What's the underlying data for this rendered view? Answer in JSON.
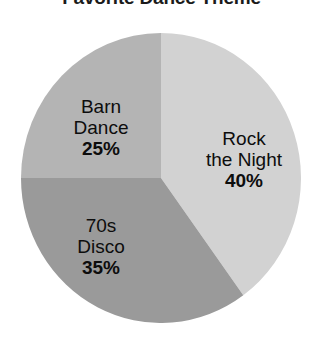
{
  "chart_data": {
    "type": "pie",
    "title": "Favorite Dance Theme",
    "categories": [
      "Rock the Night",
      "70s Disco",
      "Barn Dance"
    ],
    "values": [
      40,
      35,
      25
    ],
    "value_labels": [
      "40%",
      "35%",
      "25%"
    ],
    "units": "percent",
    "total": 100,
    "legend": "none",
    "grid": false,
    "start_angle_deg": 0,
    "direction": "clockwise",
    "slices": [
      {
        "label": "Rock the Night",
        "label_line1": "Rock",
        "label_line2": "the Night",
        "value": 40,
        "value_label": "40%",
        "color": "#d2d2d2",
        "start_deg": 0,
        "end_deg": 144
      },
      {
        "label": "70s Disco",
        "label_line1": "70s",
        "label_line2": "Disco",
        "value": 35,
        "value_label": "35%",
        "color": "#9a9a9a",
        "start_deg": 144,
        "end_deg": 270
      },
      {
        "label": "Barn Dance",
        "label_line1": "Barn",
        "label_line2": "Dance",
        "value": 25,
        "value_label": "25%",
        "color": "#b4b4b4",
        "start_deg": 270,
        "end_deg": 360
      }
    ]
  },
  "colors": {
    "background": "#ffffff",
    "title_text": "#1b1b1b",
    "label_text": "#0d0d0d",
    "slice_rock": "#d2d2d2",
    "slice_disco": "#9a9a9a",
    "slice_barn": "#b4b4b4"
  }
}
